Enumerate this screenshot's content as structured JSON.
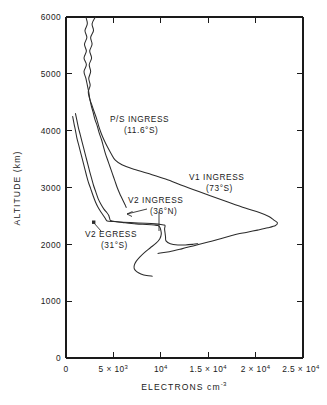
{
  "chart_data": {
    "type": "line",
    "title": "",
    "xlabel": "ELECTRONS cm",
    "xlabel_sup": "-3",
    "ylabel": "ALTITUDE (km)",
    "xlim": [
      0,
      25000
    ],
    "ylim": [
      0,
      6000
    ],
    "grid": false,
    "legend_position": "inline-annotations",
    "xticks": [
      {
        "value": 0,
        "label": "0",
        "sup": ""
      },
      {
        "value": 5000,
        "label": "5 × 10",
        "sup": "3"
      },
      {
        "value": 10000,
        "label": "10",
        "sup": "4"
      },
      {
        "value": 15000,
        "label": "1.5 × 10",
        "sup": "4"
      },
      {
        "value": 20000,
        "label": "2 × 10",
        "sup": "4"
      },
      {
        "value": 25000,
        "label": "2.5 × 10",
        "sup": "4"
      }
    ],
    "yticks": [
      {
        "value": 0,
        "label": "0"
      },
      {
        "value": 1000,
        "label": "1000"
      },
      {
        "value": 2000,
        "label": "2000"
      },
      {
        "value": 3000,
        "label": "3000"
      },
      {
        "value": 4000,
        "label": "4000"
      },
      {
        "value": 5000,
        "label": "5000"
      },
      {
        "value": 6000,
        "label": "6000"
      }
    ],
    "series": [
      {
        "name": "P/S INGRESS",
        "latitude": "(11.6°S)",
        "label_line1": "P/S INGRESS",
        "label_line2": "(11.6°S)",
        "points": [
          [
            3100,
            6000
          ],
          [
            2750,
            5880
          ],
          [
            2900,
            5760
          ],
          [
            2600,
            5640
          ],
          [
            2750,
            5520
          ],
          [
            2500,
            5400
          ],
          [
            2700,
            5280
          ],
          [
            2450,
            5160
          ],
          [
            2600,
            5040
          ],
          [
            2400,
            4920
          ],
          [
            2550,
            4800
          ],
          [
            2350,
            4680
          ],
          [
            2500,
            4560
          ],
          [
            2750,
            4440
          ],
          [
            3000,
            4320
          ],
          [
            3250,
            4200
          ],
          [
            3450,
            4080
          ],
          [
            3700,
            3960
          ],
          [
            4000,
            3840
          ],
          [
            4350,
            3720
          ],
          [
            4750,
            3600
          ],
          [
            5200,
            3480
          ],
          [
            5900,
            3400
          ],
          [
            7000,
            3330
          ],
          [
            8600,
            3250
          ],
          [
            10500,
            3150
          ],
          [
            12500,
            3020
          ],
          [
            14800,
            2880
          ],
          [
            17000,
            2750
          ],
          [
            18900,
            2640
          ],
          [
            20400,
            2560
          ],
          [
            21400,
            2490
          ],
          [
            21900,
            2430
          ],
          [
            22300,
            2380
          ],
          [
            22100,
            2330
          ],
          [
            21300,
            2290
          ],
          [
            20200,
            2250
          ],
          [
            19000,
            2210
          ],
          [
            18100,
            2180
          ],
          [
            17400,
            2150
          ],
          [
            16300,
            2100
          ],
          [
            15000,
            2040
          ],
          [
            13600,
            1980
          ],
          [
            12200,
            1920
          ],
          [
            10900,
            1870
          ],
          [
            9700,
            1840
          ]
        ]
      },
      {
        "name": "V1 INGRESS",
        "latitude": "(73°S)",
        "label_line1": "V1 INGRESS",
        "label_line2": "(73°S)",
        "points": [
          [
            2100,
            6000
          ],
          [
            2250,
            5880
          ],
          [
            2000,
            5760
          ],
          [
            2200,
            5640
          ],
          [
            1950,
            5520
          ],
          [
            2150,
            5400
          ],
          [
            1900,
            5280
          ],
          [
            2150,
            5160
          ],
          [
            1900,
            5040
          ],
          [
            2100,
            4920
          ],
          [
            2250,
            4800
          ],
          [
            2400,
            4680
          ],
          [
            2500,
            4570
          ],
          [
            2650,
            4450
          ],
          [
            2850,
            4330
          ],
          [
            3050,
            4200
          ],
          [
            3300,
            4080
          ],
          [
            3500,
            3960
          ],
          [
            3750,
            3840
          ],
          [
            3950,
            3720
          ],
          [
            4150,
            3600
          ],
          [
            4400,
            3480
          ],
          [
            4650,
            3360
          ],
          [
            4900,
            3240
          ],
          [
            5150,
            3120
          ],
          [
            5400,
            3000
          ],
          [
            5650,
            2900
          ],
          [
            5900,
            2810
          ],
          [
            6100,
            2740
          ],
          [
            6250,
            2690
          ],
          [
            6350,
            2650
          ]
        ]
      },
      {
        "name": "V2 INGRESS",
        "latitude": "(36°N)",
        "label_line1": "V2 INGRESS",
        "label_line2": "(36°N)",
        "points": [
          [
            1000,
            4300
          ],
          [
            1150,
            4180
          ],
          [
            1300,
            4060
          ],
          [
            1500,
            3930
          ],
          [
            1700,
            3800
          ],
          [
            1900,
            3670
          ],
          [
            2100,
            3540
          ],
          [
            2300,
            3410
          ],
          [
            2500,
            3280
          ],
          [
            2700,
            3160
          ],
          [
            2900,
            3040
          ],
          [
            3150,
            2920
          ],
          [
            3400,
            2800
          ],
          [
            3700,
            2700
          ],
          [
            4000,
            2620
          ],
          [
            4300,
            2560
          ],
          [
            4500,
            2510
          ],
          [
            4600,
            2460
          ],
          [
            4700,
            2420
          ],
          [
            5200,
            2400
          ],
          [
            6200,
            2380
          ],
          [
            7400,
            2360
          ],
          [
            8500,
            2350
          ],
          [
            9300,
            2340
          ],
          [
            9700,
            2330
          ],
          [
            9900,
            2300
          ],
          [
            10000,
            2250
          ],
          [
            10050,
            2180
          ],
          [
            9900,
            2100
          ],
          [
            9500,
            2020
          ],
          [
            8900,
            1940
          ],
          [
            8300,
            1860
          ],
          [
            7800,
            1780
          ],
          [
            7400,
            1700
          ],
          [
            7200,
            1630
          ],
          [
            7200,
            1570
          ],
          [
            7450,
            1520
          ],
          [
            7900,
            1480
          ],
          [
            8500,
            1450
          ],
          [
            9100,
            1440
          ]
        ]
      },
      {
        "name": "V2 EGRESS",
        "latitude": "(31°S)",
        "label_line1": "V2 EGRESS",
        "label_line2": "(31°S)",
        "points": [
          [
            700,
            4250
          ],
          [
            850,
            4120
          ],
          [
            1000,
            4000
          ],
          [
            1150,
            3870
          ],
          [
            1350,
            3740
          ],
          [
            1550,
            3610
          ],
          [
            1750,
            3480
          ],
          [
            1950,
            3350
          ],
          [
            2150,
            3220
          ],
          [
            2350,
            3100
          ],
          [
            2600,
            2980
          ],
          [
            2850,
            2860
          ],
          [
            3100,
            2750
          ],
          [
            3350,
            2660
          ],
          [
            3600,
            2590
          ],
          [
            3850,
            2530
          ],
          [
            4050,
            2480
          ],
          [
            4200,
            2440
          ],
          [
            4350,
            2410
          ],
          [
            5000,
            2400
          ],
          [
            6000,
            2390
          ],
          [
            7200,
            2380
          ],
          [
            8400,
            2370
          ],
          [
            9400,
            2360
          ],
          [
            10000,
            2350
          ],
          [
            10300,
            2340
          ],
          [
            10450,
            2330
          ],
          [
            10400,
            2270
          ],
          [
            10450,
            2200
          ],
          [
            10500,
            2130
          ],
          [
            10550,
            2060
          ],
          [
            11000,
            2010
          ],
          [
            11800,
            1990
          ],
          [
            12600,
            1990
          ],
          [
            13400,
            2000
          ],
          [
            13900,
            2010
          ]
        ]
      }
    ],
    "annotations": [
      {
        "text": "P/S INGRESS",
        "sub": "(11.6°S)",
        "x": 4700,
        "y": 4180
      },
      {
        "text": "V1 INGRESS",
        "sub": "(73°S)",
        "x": 16800,
        "y": 3150
      },
      {
        "text": "V2 INGRESS",
        "sub": "(36°N)",
        "x": 7400,
        "y": 2800
      },
      {
        "text": "V2 EGRESS",
        "sub": "(31°S)",
        "x": 3300,
        "y": 2280
      }
    ]
  },
  "figure": {
    "background_color": "#ffffff",
    "line_color": "#2b2b2b",
    "axis_color": "#1a1a1a"
  }
}
